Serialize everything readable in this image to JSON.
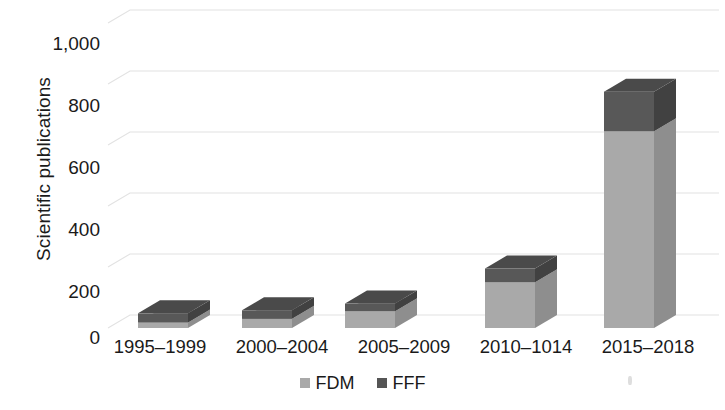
{
  "chart_data": {
    "type": "bar",
    "subtype": "stacked-3d-column",
    "title": "",
    "xlabel": "",
    "ylabel": "Scientific publications",
    "categories": [
      "1995–1999",
      "2000–2004",
      "2005–2009",
      "2010–1014",
      "2015–2018"
    ],
    "series": [
      {
        "name": "FDM",
        "color": "#a9a9a9",
        "values": [
          18,
          30,
          55,
          150,
          645
        ]
      },
      {
        "name": "FFF",
        "color": "#555555",
        "values": [
          30,
          28,
          25,
          45,
          130
        ]
      }
    ],
    "totals": [
      48,
      58,
      80,
      195,
      775
    ],
    "ylim": [
      0,
      1000
    ],
    "yticks": [
      0,
      200,
      400,
      600,
      800,
      1000
    ],
    "ytick_labels": [
      "0",
      "200",
      "400",
      "600",
      "800",
      "1,000"
    ],
    "grid": true,
    "grid_axis": "y",
    "legend": true,
    "legend_position": "bottom"
  },
  "axis": {
    "y_title": "Scientific publications",
    "y_tick_labels": [
      "1,000",
      "800",
      "600",
      "400",
      "200",
      "0"
    ],
    "x_tick_labels": [
      "1995–1999",
      "2000–2004",
      "2005–2009",
      "2010–1014",
      "2015–2018"
    ]
  },
  "legend": {
    "items": [
      {
        "label": "FDM",
        "color": "#a9a9a9"
      },
      {
        "label": "FFF",
        "color": "#555555"
      }
    ]
  },
  "colors": {
    "fdm_front": "#a9a9a9",
    "fdm_top": "#bdbdbd",
    "fdm_side": "#8e8e8e",
    "fff_front": "#585858",
    "fff_top": "#4a4a4a",
    "fff_side": "#414141",
    "grid": "#e2e2e2",
    "text": "#1a1a1a",
    "background": "#ffffff"
  }
}
